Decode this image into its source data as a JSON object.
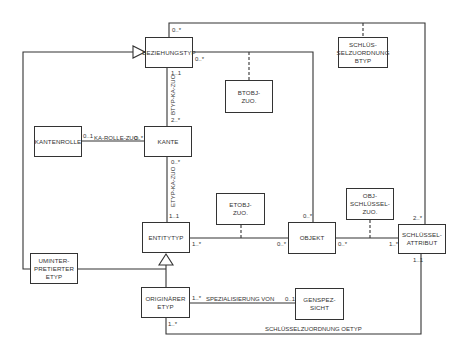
{
  "diagram": {
    "type": "UML class diagram",
    "classes": {
      "beziehungstyp": "BEZIEHUNGSTYP",
      "schluesselzuordnung_btyp": "SCHLÜS-\nSELZUORDNUNG\nBTYP",
      "btobj_zuo": "BTOBJ-\nZUO.",
      "kantenrolle": "KANTENROLLE",
      "kante": "KANTE",
      "etobj_zuo": "ETOBJ-\nZUO.",
      "obj_schluessel_zuo": "OBJ-\nSCHLÜSSEL-\nZUO.",
      "entitytyp": "ENTITYTYP",
      "objekt": "OBJEKT",
      "schluesselattribut": "SCHLÜSSEL-\nATTRIBUT",
      "uminterpretierter_etyp": "UMINTER-\nPRETIERTER\nETYP",
      "originaerer_etyp": "ORIGINÄRER\nETYP",
      "genspezsicht": "GENSPEZ-\nSICHT"
    },
    "associations": {
      "btyp_ka_zuo": "BTYP-KA-ZUO",
      "etyp_ka_zuo": "ETYP-KA-ZUO",
      "ka_rolle_zuo": "KA-ROLLE-ZUO.",
      "spezialisierung_von": "SPEZIALISIERUNG VON",
      "schluesselzuordnung_oetyp": "SCHLÜSSELZUORDNUNG OETYP"
    },
    "multiplicities": {
      "bez_top": "0..*",
      "bez_right": "0..*",
      "bez_bottom": "1..1",
      "kante_top": "2..*",
      "kante_left": "0..*",
      "kantenrolle_right": "0..1",
      "kante_bottom": "0..*",
      "entity_top": "1..1",
      "entity_right": "1..*",
      "objekt_left": "0..*",
      "objekt_top": "0..*",
      "objekt_right": "0..*",
      "schluessel_left": "1..*",
      "schluessel_top": "2..*",
      "schluessel_bottom": "1..1",
      "orig_right": "1..*",
      "orig_bottom": "1..*",
      "genspez_left": "0..1"
    }
  }
}
